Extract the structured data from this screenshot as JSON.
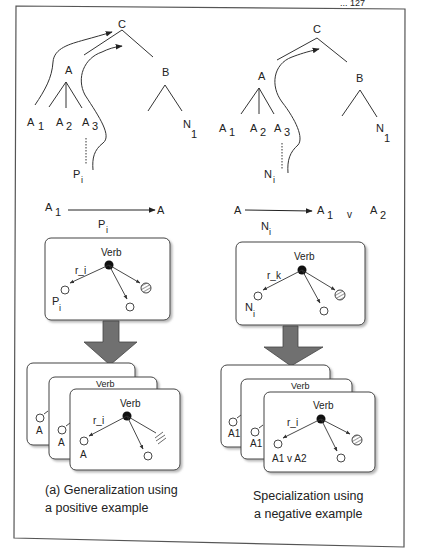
{
  "page_header": {
    "text": "... 127"
  },
  "left_panel": {
    "tree": {
      "root": "C",
      "left_node": "A",
      "right_node": "B",
      "a_children": [
        {
          "base": "A",
          "sub": "1"
        },
        {
          "base": "A",
          "sub": "2"
        },
        {
          "base": "A",
          "sub": "3"
        }
      ],
      "b_child": {
        "base": "N",
        "sub": "1"
      },
      "example": {
        "base": "P",
        "sub": "i"
      }
    },
    "rule": {
      "from": {
        "base": "A",
        "sub": "1"
      },
      "to": "A",
      "via": {
        "base": "P",
        "sub": "i"
      }
    },
    "frame_box": {
      "verb": "Verb",
      "relation": "r_i",
      "arg_label": {
        "base": "P",
        "sub": "i"
      }
    },
    "stacked_cards": {
      "back_labels": [
        "A",
        "A"
      ],
      "front_verb": "Verb",
      "front_relation": "r_i",
      "front_arg_label": "A"
    },
    "caption": [
      "(a) Generalization using",
      "a positive example"
    ]
  },
  "right_panel": {
    "tree": {
      "root": "C",
      "left_node": "A",
      "right_node": "B",
      "a_children": [
        {
          "base": "A",
          "sub": "1"
        },
        {
          "base": "A",
          "sub": "2"
        },
        {
          "base": "A",
          "sub": "3"
        }
      ],
      "b_child": {
        "base": "N",
        "sub": "1"
      },
      "example": {
        "base": "N",
        "sub": "i"
      }
    },
    "rule": {
      "from": "A",
      "to": {
        "base": "A",
        "sub": "1"
      },
      "or": "v",
      "to2": {
        "base": "A",
        "sub": "2"
      },
      "via": {
        "base": "N",
        "sub": "i"
      }
    },
    "frame_box": {
      "verb": "Verb",
      "relation": "r_k",
      "arg_label": {
        "base": "N",
        "sub": "i"
      }
    },
    "stacked_cards": {
      "back_labels": [
        "A1",
        "A1"
      ],
      "front_verb": "Verb",
      "front_relation": "r_i",
      "front_arg_label": "A1 v A2"
    },
    "caption": [
      "Specialization using",
      "a negative example"
    ]
  },
  "colors": {
    "ink": "#222222",
    "arrow_fill": "#707070",
    "arrow_stroke": "#444444",
    "frame": "#555555",
    "background": "#ffffff"
  }
}
